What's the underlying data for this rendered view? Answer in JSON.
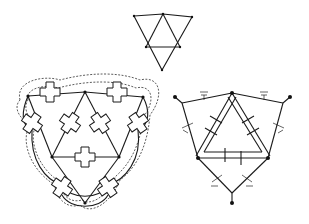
{
  "figure": {
    "panels": [
      {
        "id": "top-graph",
        "description": "Triangular graph: outer inverted triangle subdivided into four triangles",
        "nodes": 6
      },
      {
        "id": "left-layout",
        "description": "Graph with cross-shaped junction modules on edges, enclosed by dashed boundary",
        "cross_modules": 9,
        "nodes": 6
      },
      {
        "id": "right-mechanism",
        "description": "Linkage mechanism with triangular frame, double-bar members and ground hatch symbols",
        "nodes": 6,
        "ground_symbols": 6
      }
    ]
  },
  "colors": {
    "line": "#1a1a1a",
    "background": "#ffffff"
  }
}
